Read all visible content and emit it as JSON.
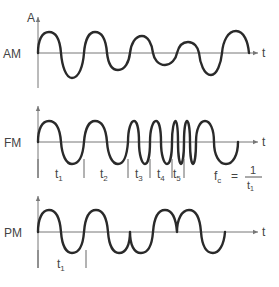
{
  "diagram": {
    "panels": [
      {
        "id": "am",
        "label": "AM",
        "y_axis_label": "A",
        "x_axis_label": "t"
      },
      {
        "id": "fm",
        "label": "FM",
        "x_axis_label": "t",
        "interval_labels": [
          {
            "base": "t",
            "sub": "1"
          },
          {
            "base": "t",
            "sub": "2"
          },
          {
            "base": "t",
            "sub": "3"
          },
          {
            "base": "t",
            "sub": "4"
          },
          {
            "base": "t",
            "sub": "5"
          }
        ],
        "formula": {
          "lhs_base": "f",
          "lhs_sub": "c",
          "eq": "=",
          "numerator": "1",
          "den_base": "t",
          "den_sub": "1"
        }
      },
      {
        "id": "pm",
        "label": "PM",
        "x_axis_label": "t",
        "interval_labels": [
          {
            "base": "t",
            "sub": "1"
          }
        ]
      }
    ]
  },
  "colors": {
    "wave": "#2a2a2a",
    "axis": "#777777",
    "text": "#444444"
  }
}
